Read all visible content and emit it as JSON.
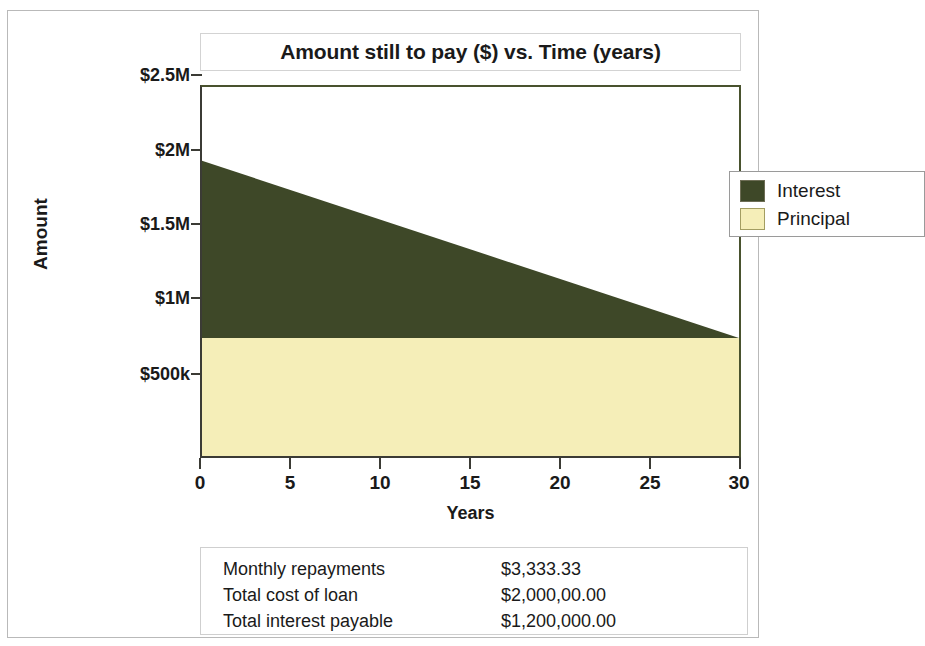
{
  "chart_data": {
    "type": "area",
    "title": "Amount still to pay ($) vs. Time (years)",
    "xlabel": "Years",
    "ylabel": "Amount",
    "xlim": [
      0,
      30
    ],
    "ylim": [
      0,
      2500000
    ],
    "grid": false,
    "stacked": true,
    "legend_position": "top-right",
    "x_ticks": [
      "0",
      "5",
      "10",
      "15",
      "20",
      "25",
      "30"
    ],
    "x_tick_values": [
      0,
      5,
      10,
      15,
      20,
      25,
      30
    ],
    "y_ticks": [
      "$500k",
      "$1M",
      "$1.5M",
      "$2M",
      "$2.5M"
    ],
    "y_tick_values": [
      500000,
      1000000,
      1500000,
      2000000,
      2500000
    ],
    "x": [
      0,
      30
    ],
    "series": [
      {
        "name": "Interest",
        "color": "#3e4828",
        "values": [
          1200000,
          0
        ],
        "description": "Interest remaining declines linearly from $1.2M at year 0 to $0 at year 30"
      },
      {
        "name": "Principal",
        "color": "#f5eeb8",
        "values": [
          800000,
          800000
        ],
        "description": "Principal component constant at $800k across the term"
      }
    ],
    "total_top_line": [
      2000000,
      800000
    ],
    "annotations": []
  },
  "title_box": {
    "title": "Amount still to pay ($) vs. Time (years)"
  },
  "legend": {
    "items": [
      {
        "label": "Interest",
        "color": "#3e4828",
        "border": "#6d6d55"
      },
      {
        "label": "Principal",
        "color": "#f5eeb8",
        "border": "#a39d61"
      }
    ]
  },
  "axes": {
    "y_title": "Amount",
    "x_title": "Years",
    "y_labels": [
      "$2.5M",
      "$2M",
      "$1.5M",
      "$1M",
      "$500k"
    ],
    "x_labels": [
      "0",
      "5",
      "10",
      "15",
      "20",
      "25",
      "30"
    ]
  },
  "summary": {
    "rows": [
      {
        "label": "Monthly repayments",
        "value": "$3,333.33"
      },
      {
        "label": "Total cost of loan",
        "value": "$2,000,00.00"
      },
      {
        "label": "Total interest payable",
        "value": "$1,200,000.00"
      }
    ]
  },
  "colors": {
    "interest": "#3e4828",
    "principal": "#f5eeb8",
    "axis": "#3b3b35",
    "plot_border": "#49522e",
    "frame": "#b9b9b9"
  }
}
